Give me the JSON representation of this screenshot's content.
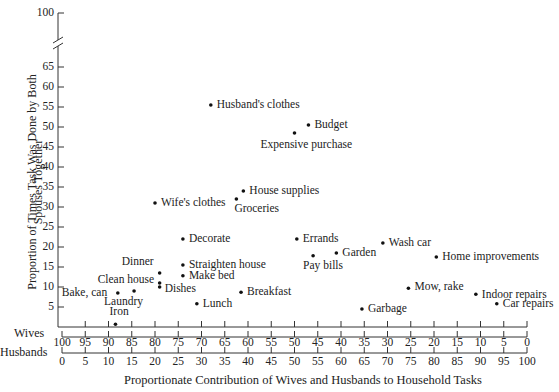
{
  "chart_data": {
    "type": "scatter",
    "title": "",
    "xlabel": "Proportionate Contribution of Wives and Husbands to Household Tasks",
    "ylabel": "Proportion of Times Task Was Done by Both Spouses Together",
    "ylabel_lines": [
      "Proportion of Times Task Was Done by Both",
      "Spouses Together"
    ],
    "ylim": [
      0,
      100
    ],
    "y_axis_break": [
      65,
      100
    ],
    "y_ticks": [
      5,
      10,
      15,
      20,
      25,
      30,
      35,
      40,
      45,
      50,
      55,
      60,
      65,
      100
    ],
    "x_axes": [
      {
        "name": "Wives",
        "ticks": [
          100,
          95,
          90,
          85,
          80,
          75,
          70,
          65,
          60,
          55,
          50,
          45,
          40,
          35,
          30,
          25,
          20,
          15,
          10,
          5,
          0
        ]
      },
      {
        "name": "Husbands",
        "ticks": [
          0,
          5,
          10,
          15,
          20,
          25,
          30,
          35,
          40,
          45,
          50,
          55,
          60,
          65,
          70,
          75,
          80,
          85,
          90,
          95,
          100
        ]
      }
    ],
    "grid": false,
    "x_field": "husbands_contribution",
    "points": [
      {
        "label": "Husband's clothes",
        "x": 32,
        "y": 55.5
      },
      {
        "label": "Budget",
        "x": 53,
        "y": 50.5
      },
      {
        "label": "Expensive purchase",
        "x": 50,
        "y": 48.5
      },
      {
        "label": "House supplies",
        "x": 39,
        "y": 34
      },
      {
        "label": "Groceries",
        "x": 37.5,
        "y": 32
      },
      {
        "label": "Wife's clothes",
        "x": 20,
        "y": 31
      },
      {
        "label": "Decorate",
        "x": 26,
        "y": 22
      },
      {
        "label": "Errands",
        "x": 50.5,
        "y": 22
      },
      {
        "label": "Wash car",
        "x": 69,
        "y": 21
      },
      {
        "label": "Garden",
        "x": 59,
        "y": 18.5
      },
      {
        "label": "Pay bills",
        "x": 54,
        "y": 17.8
      },
      {
        "label": "Home improvements",
        "x": 80.5,
        "y": 17.5
      },
      {
        "label": "Straighten house",
        "x": 26,
        "y": 15.5
      },
      {
        "label": "Dinner",
        "x": 21,
        "y": 13.5
      },
      {
        "label": "Make bed",
        "x": 26,
        "y": 12.8
      },
      {
        "label": "Clean house",
        "x": 21,
        "y": 11
      },
      {
        "label": "Dishes",
        "x": 21,
        "y": 10
      },
      {
        "label": "Mow, rake",
        "x": 74.5,
        "y": 9.7
      },
      {
        "label": "Laundry",
        "x": 15.5,
        "y": 9
      },
      {
        "label": "Breakfast",
        "x": 38.5,
        "y": 8.7
      },
      {
        "label": "Bake, can",
        "x": 12,
        "y": 8.5
      },
      {
        "label": "Indoor repairs",
        "x": 89,
        "y": 8.2
      },
      {
        "label": "Lunch",
        "x": 29,
        "y": 5.8
      },
      {
        "label": "Car repairs",
        "x": 93.5,
        "y": 5.8
      },
      {
        "label": "Garbage",
        "x": 64.5,
        "y": 4.5
      },
      {
        "label": "Iron",
        "x": 11.5,
        "y": 0.7
      }
    ]
  },
  "labels": {
    "ylabel_line1": "Proportion of Times Task Was Done by Both",
    "ylabel_line2": "Spouses Together",
    "xlabel": "Proportionate Contribution of Wives and Husbands to Household Tasks",
    "wives": "Wives",
    "husbands": "Husbands",
    "y100": "100"
  }
}
